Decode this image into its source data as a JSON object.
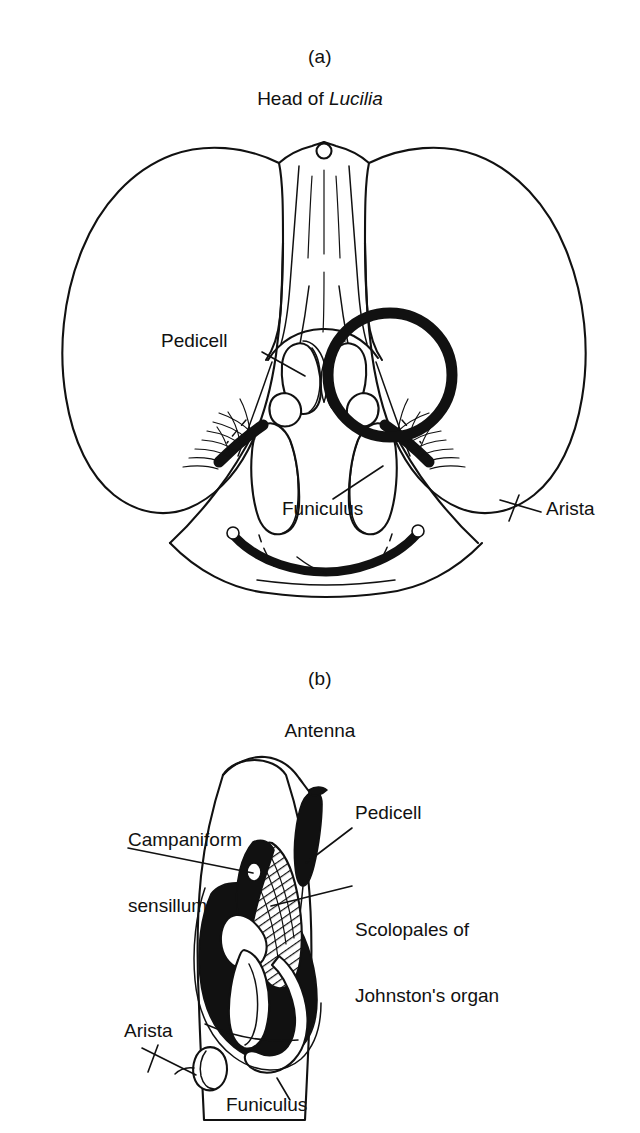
{
  "figure": {
    "background": "#ffffff",
    "ink": "#111111",
    "panels": [
      {
        "id": "a",
        "letter": "(a)",
        "title_prefix": "Head of ",
        "title_scientific": "Lucilia",
        "labels": [
          {
            "name": "pedicell",
            "text": "Pedicell"
          },
          {
            "name": "funiculus",
            "text": "Funiculus"
          },
          {
            "name": "arista",
            "text": "Arista"
          }
        ],
        "highlight": {
          "name": "circle-highlight",
          "shape": "circle",
          "cx": 390,
          "cy": 375,
          "r": 62
        }
      },
      {
        "id": "b",
        "letter": "(b)",
        "title_prefix": "Antenna",
        "title_scientific": "",
        "labels": [
          {
            "name": "campaniform-sensillum",
            "line1": "Campaniform",
            "line2": "sensillum"
          },
          {
            "name": "pedicell",
            "text": "Pedicell"
          },
          {
            "name": "scolopales",
            "line1": "Scolopales of",
            "line2": "Johnston's organ"
          },
          {
            "name": "arista",
            "text": "Arista"
          },
          {
            "name": "funiculus",
            "text": "Funiculus"
          }
        ]
      }
    ]
  },
  "panel_a": {
    "letter": "(a)",
    "title_prefix": "Head of ",
    "title_scientific": "Lucilia",
    "label_pedicell": "Pedicell",
    "label_funiculus": "Funiculus",
    "label_arista": "Arista"
  },
  "panel_b": {
    "letter": "(b)",
    "title": "Antenna",
    "label_campaniform_1": "Campaniform",
    "label_campaniform_2": "sensillum",
    "label_pedicell": "Pedicell",
    "label_scolopales_1": "Scolopales of",
    "label_scolopales_2": "Johnston's organ",
    "label_arista": "Arista",
    "label_funiculus": "Funiculus"
  }
}
